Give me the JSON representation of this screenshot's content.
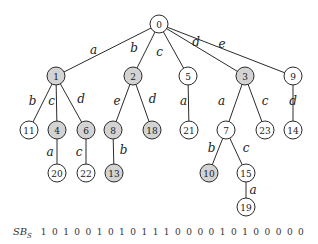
{
  "diagram": {
    "type": "trie",
    "colors": {
      "marked_fill": "#d3d3d3",
      "unmarked_fill": "#ffffff",
      "stroke": "#2a2a2a"
    },
    "nodes": [
      {
        "id": "0",
        "marked": false
      },
      {
        "id": "1",
        "marked": true
      },
      {
        "id": "2",
        "marked": true
      },
      {
        "id": "5",
        "marked": false
      },
      {
        "id": "3",
        "marked": true
      },
      {
        "id": "9",
        "marked": false
      },
      {
        "id": "11",
        "marked": false
      },
      {
        "id": "4",
        "marked": true
      },
      {
        "id": "6",
        "marked": true
      },
      {
        "id": "8",
        "marked": true
      },
      {
        "id": "18",
        "marked": true
      },
      {
        "id": "21",
        "marked": false
      },
      {
        "id": "7",
        "marked": false
      },
      {
        "id": "23",
        "marked": false
      },
      {
        "id": "14",
        "marked": false
      },
      {
        "id": "20",
        "marked": false
      },
      {
        "id": "22",
        "marked": false
      },
      {
        "id": "13",
        "marked": true
      },
      {
        "id": "10",
        "marked": true
      },
      {
        "id": "15",
        "marked": false
      },
      {
        "id": "19",
        "marked": false
      }
    ],
    "edges": [
      {
        "from": "0",
        "to": "1",
        "label": "a"
      },
      {
        "from": "0",
        "to": "2",
        "label": "b"
      },
      {
        "from": "0",
        "to": "5",
        "label": "c"
      },
      {
        "from": "0",
        "to": "3",
        "label": "d"
      },
      {
        "from": "0",
        "to": "9",
        "label": "e"
      },
      {
        "from": "1",
        "to": "11",
        "label": "b"
      },
      {
        "from": "1",
        "to": "4",
        "label": "c"
      },
      {
        "from": "1",
        "to": "6",
        "label": "d"
      },
      {
        "from": "2",
        "to": "8",
        "label": "e"
      },
      {
        "from": "2",
        "to": "18",
        "label": "d"
      },
      {
        "from": "5",
        "to": "21",
        "label": "a"
      },
      {
        "from": "3",
        "to": "7",
        "label": "a"
      },
      {
        "from": "3",
        "to": "23",
        "label": "c"
      },
      {
        "from": "9",
        "to": "14",
        "label": "d"
      },
      {
        "from": "4",
        "to": "20",
        "label": "a"
      },
      {
        "from": "6",
        "to": "22",
        "label": "c"
      },
      {
        "from": "8",
        "to": "13",
        "label": "b"
      },
      {
        "from": "7",
        "to": "10",
        "label": "b"
      },
      {
        "from": "7",
        "to": "15",
        "label": "c"
      },
      {
        "from": "15",
        "to": "19",
        "label": "a"
      }
    ]
  },
  "bitstring": {
    "label_main": "SB",
    "label_sub": "S",
    "value": "1 0 1 0 0 1 0 1 0 1 1 1 0 0 0 0 1 0 1 0 0 0 0 0"
  }
}
